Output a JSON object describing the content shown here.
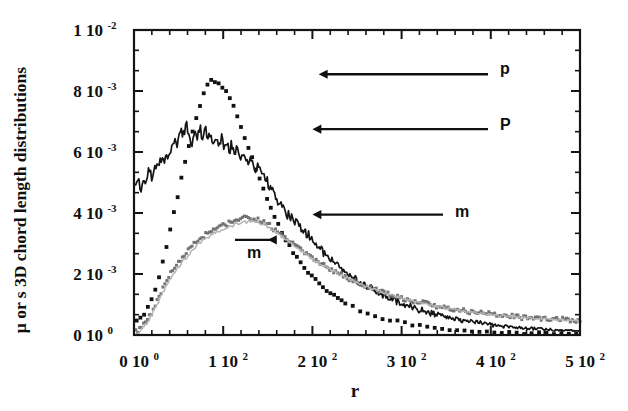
{
  "chart_data": {
    "type": "line",
    "title": "",
    "xlabel": "r",
    "ylabel": "μ or s 3D chord length distributions",
    "xlim": [
      0,
      500
    ],
    "ylim": [
      0,
      0.01
    ],
    "grid": false,
    "legend": "annotations-with-arrows",
    "x_tick_labels": [
      {
        "mantissa": "0",
        "base": "10",
        "exp": "0",
        "value": 0
      },
      {
        "mantissa": "1",
        "base": "10",
        "exp": "2",
        "value": 100
      },
      {
        "mantissa": "2",
        "base": "10",
        "exp": "2",
        "value": 200
      },
      {
        "mantissa": "3",
        "base": "10",
        "exp": "2",
        "value": 300
      },
      {
        "mantissa": "4",
        "base": "10",
        "exp": "2",
        "value": 400
      },
      {
        "mantissa": "5",
        "base": "10",
        "exp": "2",
        "value": 500
      }
    ],
    "y_tick_labels": [
      {
        "mantissa": "1",
        "base": "10",
        "exp": "-2",
        "value": 0.01
      },
      {
        "mantissa": "8",
        "base": "10",
        "exp": "-3",
        "value": 0.008
      },
      {
        "mantissa": "6",
        "base": "10",
        "exp": "-3",
        "value": 0.006
      },
      {
        "mantissa": "4",
        "base": "10",
        "exp": "-3",
        "value": 0.004
      },
      {
        "mantissa": "2",
        "base": "10",
        "exp": "-3",
        "value": 0.002
      },
      {
        "mantissa": "0",
        "base": "10",
        "exp": "0",
        "value": 0
      }
    ],
    "x_minor_ticks_per_major": 4,
    "y_minor_ticks_per_major": 2,
    "annotations": [
      {
        "label": "p",
        "text_x": 500,
        "text_y": 0.00875,
        "arrow_to_x": 207,
        "arrow_to_y": 0.00855
      },
      {
        "label": "P",
        "text_x": 500,
        "text_y": 0.00692,
        "arrow_to_x": 200,
        "arrow_to_y": 0.00675
      },
      {
        "label": "m",
        "text_x": 455,
        "text_y": 0.00405,
        "arrow_to_x": 200,
        "arrow_to_y": 0.00395
      },
      {
        "label": "m",
        "text_x": 217,
        "text_y": 0.00272,
        "arrow_to_x": 150,
        "arrow_to_y": 0.00312
      }
    ],
    "series": [
      {
        "name": "p",
        "style": "dotted",
        "color": "#111111",
        "marker": "square-dot",
        "peak_x": 78,
        "peak_y": 0.00835,
        "x": [
          3,
          6,
          9,
          12,
          15,
          18,
          21,
          24,
          27,
          30,
          33,
          36,
          39,
          42,
          45,
          48,
          51,
          54,
          57,
          60,
          63,
          66,
          69,
          72,
          75,
          78,
          81,
          84,
          87,
          90,
          93,
          96,
          99,
          102,
          105,
          108,
          111,
          114,
          117,
          120,
          124,
          128,
          132,
          136,
          140,
          145,
          150,
          155,
          160,
          165,
          170,
          175,
          180,
          185,
          190,
          196,
          202,
          208,
          214,
          220,
          228,
          236,
          244,
          252,
          260,
          270,
          280,
          290,
          300,
          312,
          324,
          336,
          348,
          360,
          375,
          390,
          405,
          420,
          437,
          455,
          473,
          490,
          500
        ],
        "y": [
          0.00046,
          0.00052,
          0.00061,
          0.00072,
          0.00086,
          0.00104,
          0.00126,
          0.00152,
          0.00181,
          0.00213,
          0.00248,
          0.00285,
          0.00323,
          0.00362,
          0.00402,
          0.00443,
          0.00484,
          0.00525,
          0.00565,
          0.00603,
          0.00639,
          0.00673,
          0.00704,
          0.00733,
          0.00759,
          0.0079,
          0.00812,
          0.00827,
          0.00835,
          0.00832,
          0.00826,
          0.00822,
          0.0081,
          0.00806,
          0.0079,
          0.0077,
          0.00752,
          0.0073,
          0.00706,
          0.00682,
          0.0065,
          0.00617,
          0.00584,
          0.00551,
          0.00518,
          0.00478,
          0.0044,
          0.00404,
          0.00371,
          0.00341,
          0.00313,
          0.00288,
          0.00265,
          0.00244,
          0.00225,
          0.00204,
          0.00185,
          0.00168,
          0.00153,
          0.00139,
          0.00122,
          0.00107,
          0.00094,
          0.00083,
          0.00073,
          0.00063,
          0.00054,
          0.00047,
          0.00041,
          0.00034,
          0.00029,
          0.00025,
          0.00021,
          0.00018,
          0.00015,
          0.00012,
          0.0001,
          9e-05,
          7e-05,
          6e-05,
          5e-05,
          4e-05,
          4e-05
        ]
      },
      {
        "name": "P",
        "style": "solid-noisy",
        "color": "#141414",
        "peak_x": 58,
        "peak_y": 0.0069,
        "x": [
          2,
          5,
          8,
          11,
          14,
          17,
          20,
          23,
          26,
          29,
          32,
          35,
          38,
          41,
          44,
          47,
          50,
          53,
          56,
          59,
          62,
          65,
          68,
          71,
          74,
          77,
          80,
          83,
          86,
          89,
          92,
          95,
          98,
          101,
          104,
          107,
          110,
          113,
          116,
          119,
          123,
          127,
          131,
          135,
          139,
          143,
          148,
          153,
          158,
          163,
          168,
          174,
          180,
          186,
          192,
          198,
          205,
          212,
          219,
          226,
          234,
          242,
          250,
          260,
          270,
          280,
          292,
          304,
          316,
          330,
          344,
          358,
          372,
          388,
          404,
          420,
          438,
          456,
          474,
          492,
          500
        ],
        "y": [
          0.0048,
          0.00505,
          0.00478,
          0.0052,
          0.00495,
          0.00545,
          0.00518,
          0.0056,
          0.00542,
          0.0058,
          0.00565,
          0.006,
          0.00583,
          0.00622,
          0.00605,
          0.00645,
          0.00628,
          0.00665,
          0.0065,
          0.0069,
          0.00662,
          0.00628,
          0.00674,
          0.0064,
          0.00682,
          0.00648,
          0.00676,
          0.0063,
          0.00668,
          0.00625,
          0.0066,
          0.00615,
          0.0065,
          0.00605,
          0.0064,
          0.00598,
          0.00632,
          0.00588,
          0.0062,
          0.00575,
          0.006,
          0.00565,
          0.00582,
          0.00548,
          0.0056,
          0.0053,
          0.00508,
          0.0048,
          0.00456,
          0.00432,
          0.00412,
          0.00392,
          0.00375,
          0.00358,
          0.0034,
          0.0032,
          0.00298,
          0.00276,
          0.00255,
          0.00235,
          0.00214,
          0.00196,
          0.0018,
          0.00161,
          0.00144,
          0.0013,
          0.00114,
          0.001,
          0.00088,
          0.00075,
          0.00064,
          0.00055,
          0.00047,
          0.00039,
          0.00033,
          0.00028,
          0.00023,
          0.00019,
          0.00016,
          0.00014,
          0.00013
        ]
      },
      {
        "name": "m-dark",
        "style": "dotted-noisy",
        "color": "#6a6a6a",
        "peak_x": 132,
        "peak_y": 0.00385,
        "x": [
          2,
          6,
          10,
          14,
          18,
          22,
          26,
          30,
          34,
          38,
          42,
          46,
          50,
          54,
          58,
          62,
          66,
          70,
          74,
          78,
          82,
          86,
          90,
          94,
          98,
          102,
          106,
          110,
          114,
          118,
          122,
          126,
          130,
          134,
          138,
          142,
          147,
          152,
          157,
          162,
          168,
          174,
          180,
          186,
          192,
          200,
          208,
          216,
          224,
          232,
          242,
          252,
          262,
          272,
          284,
          296,
          308,
          320,
          334,
          348,
          362,
          378,
          394,
          410,
          428,
          446,
          464,
          482,
          500
        ],
        "y": [
          0.0001,
          0.00018,
          0.0003,
          0.00046,
          0.00066,
          0.00088,
          0.00112,
          0.00138,
          0.00162,
          0.00185,
          0.00205,
          0.00222,
          0.00238,
          0.00255,
          0.00268,
          0.00282,
          0.00295,
          0.00306,
          0.00316,
          0.00325,
          0.00333,
          0.0034,
          0.00346,
          0.00352,
          0.00357,
          0.00362,
          0.00366,
          0.0037,
          0.00374,
          0.00378,
          0.00381,
          0.00384,
          0.00385,
          0.00383,
          0.0038,
          0.00375,
          0.00368,
          0.00358,
          0.00347,
          0.00336,
          0.00322,
          0.00308,
          0.00294,
          0.00281,
          0.00268,
          0.00252,
          0.00237,
          0.00223,
          0.0021,
          0.00198,
          0.00184,
          0.00171,
          0.00159,
          0.00148,
          0.00136,
          0.00125,
          0.00116,
          0.00107,
          0.00098,
          0.0009,
          0.00083,
          0.00076,
          0.0007,
          0.00065,
          0.0006,
          0.00056,
          0.00053,
          0.0005,
          0.00048
        ]
      },
      {
        "name": "m-light",
        "style": "solid-noisy",
        "color": "#b4b4b4",
        "peak_x": 140,
        "peak_y": 0.00372,
        "x": [
          2,
          6,
          10,
          14,
          18,
          22,
          26,
          30,
          34,
          38,
          42,
          46,
          50,
          54,
          58,
          62,
          66,
          70,
          74,
          78,
          82,
          86,
          90,
          94,
          98,
          102,
          106,
          110,
          114,
          118,
          122,
          126,
          130,
          134,
          138,
          142,
          147,
          152,
          157,
          162,
          168,
          174,
          180,
          186,
          192,
          200,
          208,
          216,
          224,
          232,
          242,
          252,
          262,
          272,
          284,
          296,
          308,
          320,
          334,
          348,
          362,
          378,
          394,
          410,
          428,
          446,
          464,
          482,
          500
        ],
        "y": [
          6e-05,
          0.00013,
          0.00024,
          0.00039,
          0.00058,
          0.00079,
          0.00102,
          0.00127,
          0.0015,
          0.00172,
          0.00192,
          0.00209,
          0.00225,
          0.00241,
          0.00255,
          0.00268,
          0.00281,
          0.00292,
          0.00302,
          0.00311,
          0.00319,
          0.00327,
          0.00333,
          0.00339,
          0.00345,
          0.0035,
          0.00355,
          0.00359,
          0.00363,
          0.00366,
          0.00369,
          0.00371,
          0.00372,
          0.00372,
          0.0037,
          0.00367,
          0.00361,
          0.00352,
          0.00342,
          0.00331,
          0.00318,
          0.00304,
          0.00291,
          0.00278,
          0.00265,
          0.00249,
          0.00234,
          0.00221,
          0.00208,
          0.00196,
          0.00182,
          0.0017,
          0.00158,
          0.00147,
          0.00135,
          0.00124,
          0.00115,
          0.00106,
          0.00097,
          0.00089,
          0.00082,
          0.00075,
          0.00069,
          0.00064,
          0.00059,
          0.00055,
          0.00052,
          0.00049,
          0.00047
        ]
      }
    ]
  },
  "axes": {
    "x_title": "r",
    "y_title_parts": [
      "μ",
      "or s 3D chord length distributions"
    ],
    "y_title_full": "μ or s 3D chord length distributions"
  }
}
